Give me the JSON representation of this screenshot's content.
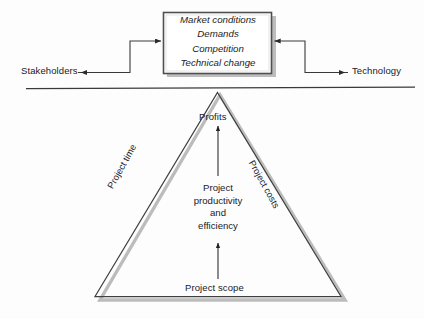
{
  "diagram": {
    "title_absent": true,
    "external_factors_box": {
      "name": "external-factors-box",
      "lines": [
        "Market conditions",
        "Demands",
        "Competition",
        "Technical change"
      ],
      "text": "Market conditions\nDemands\nCompetition\nTechnical change",
      "style": "italic",
      "border_color": "#4a4a4a",
      "fill_color": "#ffffff",
      "shadow_color": "#b3b3b3"
    },
    "endpoints": {
      "left": "Stakeholders",
      "right": "Technology"
    },
    "divider": {
      "name": "horizontal-divider",
      "color": "#3a3a3a"
    },
    "triangle": {
      "apex_label": "Profits",
      "left_leg_label": "Project time",
      "right_leg_label": "Project costs",
      "center_label_lines": [
        "Project",
        "productivity",
        "and",
        "efficiency"
      ],
      "center_label": "Project\nproductivity\nand\nefficiency",
      "base_label": "Project scope",
      "outline_color": "#3f3f3f",
      "shadow_color": "#b9b9b9"
    },
    "arrows": {
      "to_box_from_left": "arrow pointing right into box",
      "to_box_from_right": "arrow pointing left into box",
      "to_stakeholders": "arrow pointing left to Stakeholders",
      "to_technology": "arrow pointing right to Technology",
      "scope_to_productivity": "arrow pointing up",
      "productivity_to_profits": "arrow pointing up",
      "color": "#2b2b2b"
    }
  }
}
